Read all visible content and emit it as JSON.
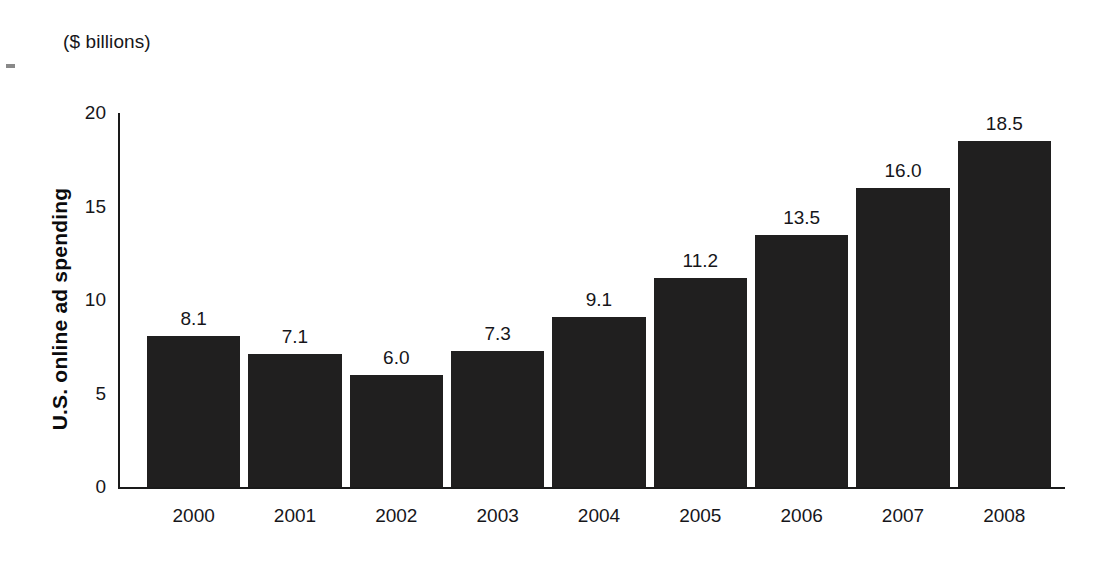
{
  "figure": {
    "unit_caption": "($ billions)",
    "y_axis_title": "U.S. online ad spending"
  },
  "chart_data": {
    "type": "bar",
    "title": "",
    "subtitle": "",
    "xlabel": "",
    "ylabel": "U.S. online ad spending",
    "unit_caption": "($ billions)",
    "categories": [
      "2000",
      "2001",
      "2002",
      "2003",
      "2004",
      "2005",
      "2006",
      "2007",
      "2008"
    ],
    "values": [
      8.1,
      7.1,
      6.0,
      7.3,
      9.1,
      11.2,
      13.5,
      16.0,
      18.5
    ],
    "value_labels": [
      "8.1",
      "7.1",
      "6.0",
      "7.3",
      "9.1",
      "11.2",
      "13.5",
      "16.0",
      "18.5"
    ],
    "ylim": [
      0,
      20
    ],
    "yticks": [
      0,
      5,
      10,
      15,
      20
    ],
    "ytick_labels": [
      "0",
      "5",
      "10",
      "15",
      "20"
    ],
    "grid": false,
    "legend": null,
    "bar_color": "#201f1f",
    "background_color": "#ffffff",
    "axis_color": "#1a1a1a",
    "annotations": []
  }
}
